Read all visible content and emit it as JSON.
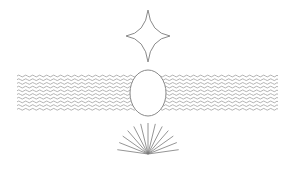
{
  "canvas": {
    "width": 294,
    "height": 174,
    "background": "#ffffff"
  },
  "colors": {
    "stroke": "#8a8a8a",
    "wave_stroke": "#a0a0a0",
    "fan_stroke": "#7a7a7a",
    "fill": "#ffffff"
  },
  "shapes": {
    "star": {
      "type": "astroid-star",
      "cx": 148,
      "cy": 36,
      "rx": 22,
      "ry": 26
    },
    "waves": {
      "type": "wavy-lines",
      "x_start": 17,
      "x_end": 278,
      "y_start": 76,
      "count": 10,
      "spacing": 3.7,
      "amplitude": 0.9,
      "wavelength": 7
    },
    "ellipse": {
      "type": "ellipse",
      "cx": 148,
      "cy": 93,
      "rx": 18,
      "ry": 23
    },
    "fan": {
      "type": "ray-fan",
      "cx": 148,
      "cy": 154,
      "length": 31,
      "count": 13,
      "angle_start": 8,
      "angle_end": 172
    }
  }
}
